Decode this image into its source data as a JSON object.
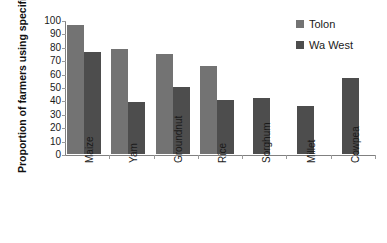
{
  "chart_data": {
    "type": "bar",
    "title": "",
    "xlabel": "",
    "ylabel": "Proportion of farmers using specific crop (%)",
    "ylim": [
      0,
      100
    ],
    "ytick_values": [
      100,
      90,
      80,
      70,
      60,
      50,
      40,
      30,
      20,
      10,
      0
    ],
    "ytick_labels": [
      "100",
      "90",
      "80",
      "70",
      "60",
      "50",
      "40",
      "30",
      "20",
      "10",
      "0"
    ],
    "grid": false,
    "legend_position": "top-right",
    "categories": [
      "Maize",
      "Yam",
      "Groundnut",
      "Rice",
      "Sorghum",
      "Millet",
      "Cowpea"
    ],
    "series": [
      {
        "name": "Tolon",
        "color": "#737373",
        "values": [
          96,
          78,
          75,
          66,
          null,
          null,
          null
        ]
      },
      {
        "name": "Wa West",
        "color": "#4d4d4d",
        "values": [
          76,
          39,
          50,
          40,
          42,
          36,
          57
        ]
      }
    ]
  },
  "legend": {
    "items": [
      {
        "label": "Tolon",
        "swatch": "legend-swatch-tolon"
      },
      {
        "label": "Wa West",
        "swatch": "legend-swatch-wawest"
      }
    ]
  },
  "colors": {
    "tolon": "#737373",
    "wawest": "#4d4d4d",
    "axis": "#808080",
    "text": "#1a1a1a",
    "background": "#ffffff"
  }
}
